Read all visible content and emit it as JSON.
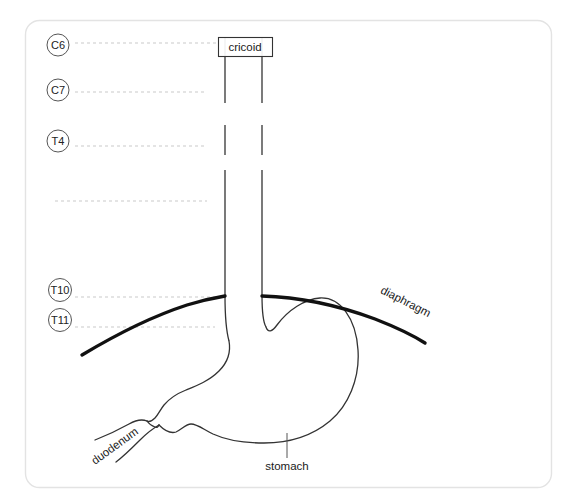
{
  "figure": {
    "background_color": "#ffffff",
    "card": {
      "border_color": "#e3e3e3",
      "fill": "#ffffff",
      "x": 25,
      "y": 20,
      "width": 526,
      "height": 467,
      "radius": 14
    }
  },
  "colors": {
    "organ_stroke": "#333333",
    "diaphragm_stroke": "#111111",
    "guide_dash": "#c9c9c9",
    "level_circle_stroke": "#555555",
    "label_text": "#1a1a1a",
    "box_stroke": "#333333"
  },
  "vertebral_levels": [
    {
      "label": "C6",
      "cx": 58,
      "cy": 45,
      "guide_y": 43,
      "guide_x2": 218,
      "has_circle": true
    },
    {
      "label": "C7",
      "cx": 58,
      "cy": 90,
      "guide_y": 92,
      "guide_x2": 207,
      "has_circle": true
    },
    {
      "label": "T4",
      "cx": 58,
      "cy": 141,
      "guide_y": 146,
      "guide_x2": 207,
      "has_circle": true
    },
    {
      "label": "",
      "cx": 58,
      "cy": 201,
      "guide_y": 201,
      "guide_x2": 207,
      "has_circle": false
    },
    {
      "label": "T10",
      "cx": 58,
      "cy": 290,
      "guide_y": 297,
      "guide_x2": 226,
      "has_circle": true
    },
    {
      "label": "T11",
      "cx": 58,
      "cy": 320,
      "guide_y": 327,
      "guide_x2": 215,
      "has_circle": true
    }
  ],
  "annotations": {
    "cricoid": {
      "label": "cricoid",
      "box": {
        "x": 218,
        "y": 37,
        "width": 54,
        "height": 19
      },
      "text_x": 245,
      "text_y": 50
    },
    "diaphragm": {
      "label": "diaphragm",
      "text_x": 404,
      "text_y": 305,
      "rotation": 27
    },
    "duodenum": {
      "label": "duodenum",
      "text_x": 117,
      "text_y": 449,
      "rotation": -36
    },
    "stomach": {
      "label": "stomach",
      "text_x": 287,
      "text_y": 470,
      "leader": {
        "x1": 287,
        "y1": 433,
        "x2": 287,
        "y2": 458
      }
    }
  },
  "esophagus": {
    "left_wall_x": 225,
    "right_wall_x": 262,
    "segments_left": [
      {
        "y1": 37,
        "y2": 103
      },
      {
        "y1": 125,
        "y2": 155
      },
      {
        "y1": 170,
        "y2": 296
      }
    ],
    "segments_right": [
      {
        "y1": 37,
        "y2": 103
      },
      {
        "y1": 125,
        "y2": 155
      },
      {
        "y1": 170,
        "y2": 300
      }
    ]
  },
  "structures": [
    {
      "name": "diaphragm-left",
      "stroke_width": 3.4
    },
    {
      "name": "diaphragm-right",
      "stroke_width": 3.4
    },
    {
      "name": "stomach-outline",
      "stroke_width": 1.3
    },
    {
      "name": "duodenum-upper",
      "stroke_width": 1.3
    },
    {
      "name": "duodenum-lower",
      "stroke_width": 1.3
    }
  ]
}
